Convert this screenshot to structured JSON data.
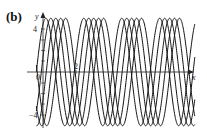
{
  "panel": {
    "label": "(b)"
  },
  "chart_data": {
    "type": "line",
    "title": "",
    "xlabel": "x",
    "ylabel": "y",
    "y_ticks": [
      -4,
      0,
      4
    ],
    "x_ticks": [
      0,
      2
    ],
    "tick_labels": {
      "y_top": "4",
      "y_bottom": "−4",
      "origin": "0",
      "x_tick": "2"
    },
    "ylim": [
      -5,
      5
    ],
    "xlim": [
      -1,
      9.2
    ],
    "grid": false,
    "legend": null,
    "series": [
      {
        "name": "curve-1",
        "amplitude": 5,
        "period": 2.3,
        "phase_shift": 0.0
      },
      {
        "name": "curve-2",
        "amplitude": 5,
        "period": 2.3,
        "phase_shift": 0.3
      },
      {
        "name": "curve-3",
        "amplitude": 5,
        "period": 2.3,
        "phase_shift": 0.6
      },
      {
        "name": "curve-4",
        "amplitude": 5,
        "period": 2.3,
        "phase_shift": 0.9
      },
      {
        "name": "curve-5",
        "amplitude": 5,
        "period": 2.3,
        "phase_shift": 1.2
      }
    ]
  },
  "colors": {
    "curve": "#111111",
    "axis": "#222222"
  }
}
